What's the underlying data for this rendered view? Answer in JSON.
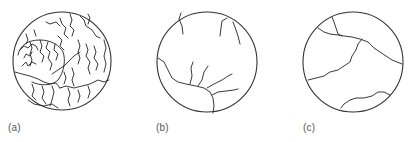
{
  "figure": {
    "panels": [
      {
        "id": "a",
        "label": "(a)",
        "description": "Dense dendritic crack network within circular field"
      },
      {
        "id": "b",
        "label": "(b)",
        "description": "Sparse branching crack network within circular field"
      },
      {
        "id": "c",
        "label": "(c)",
        "description": "Few long cracks within circular field"
      }
    ],
    "colors": {
      "line": "#222222",
      "circle": "#333333",
      "label": "#555555",
      "background": "#ffffff"
    }
  }
}
